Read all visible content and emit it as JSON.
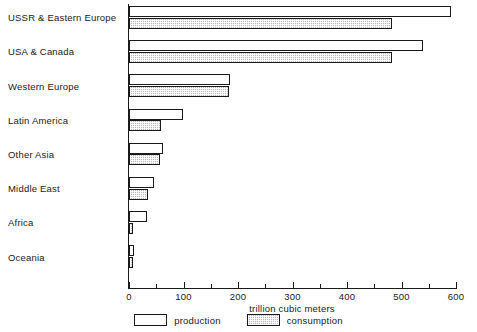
{
  "chart_data": {
    "type": "bar",
    "orientation": "horizontal",
    "title": "",
    "xlabel": "trillion cubic meters",
    "ylabel": "",
    "xlim": [
      0,
      600
    ],
    "xticks": [
      0,
      100,
      200,
      300,
      400,
      500,
      600
    ],
    "xtick_labels": [
      "0",
      "100",
      "200",
      "300",
      "400",
      "500",
      "600"
    ],
    "minor_tick_step": 50,
    "grid": false,
    "legend_position": "bottom-center",
    "categories": [
      "USSR & Eastern Europe",
      "USA & Canada",
      "Western Europe",
      "Latin America",
      "Other Asia",
      "Middle East",
      "Africa",
      "Oceania"
    ],
    "series": [
      {
        "name": "production",
        "color": "#ffffff",
        "values": [
          590,
          540,
          185,
          99,
          62,
          46,
          33,
          10
        ]
      },
      {
        "name": "consumption",
        "color": "#b9b9b9",
        "values": [
          483,
          482,
          183,
          59,
          57,
          35,
          8,
          7
        ]
      }
    ]
  },
  "legend": {
    "items": [
      {
        "label": "production"
      },
      {
        "label": "consumption"
      }
    ]
  }
}
